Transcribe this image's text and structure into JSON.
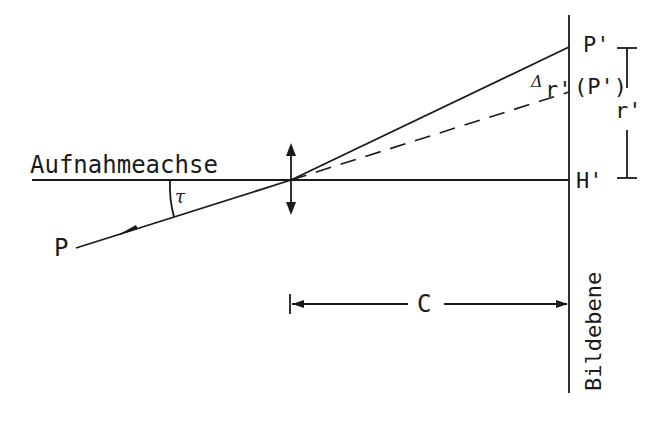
{
  "diagram": {
    "type": "optical-geometry",
    "description_labels": {
      "axis": "Aufnahmeachse",
      "image_plane": "Bildebene",
      "object_point": "P",
      "image_point": "P'",
      "ideal_image_point": "(P')",
      "principal_point": "H'",
      "radial_distance": "r'",
      "distortion": "Δr'",
      "distortion_symbol": "Δ",
      "distortion_var": "r'",
      "angle": "τ",
      "camera_constant": "C"
    },
    "colors": {
      "line": "#1a1a1a",
      "background": "#ffffff"
    }
  }
}
